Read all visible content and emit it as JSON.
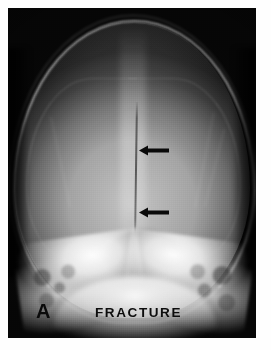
{
  "figure": {
    "domain": "medical-radiograph",
    "modality": "X-ray",
    "view": "skull anteroposterior / Towne view",
    "panel_letter": "A",
    "caption_label": "FRACTURE",
    "background_color": "#ffffff",
    "film_color": "#090909",
    "annotation_color": "#0a0a0a"
  },
  "annotations": {
    "arrows": [
      {
        "name": "upper-fracture-arrow",
        "direction": "left",
        "points_to": "fracture line, upper extent",
        "color": "#0a0a0a"
      },
      {
        "name": "lower-fracture-arrow",
        "direction": "left",
        "points_to": "fracture line, lower extent",
        "color": "#0a0a0a"
      }
    ],
    "labels": [
      {
        "name": "panel-letter",
        "text": "A"
      },
      {
        "name": "fracture-caption",
        "text": "FRACTURE"
      }
    ]
  },
  "anatomy": {
    "structures": [
      "cranial vault",
      "sagittal midline",
      "fracture line",
      "foramen magnum",
      "left petrous ridge",
      "right petrous ridge",
      "mastoid air cells",
      "skull base"
    ]
  }
}
